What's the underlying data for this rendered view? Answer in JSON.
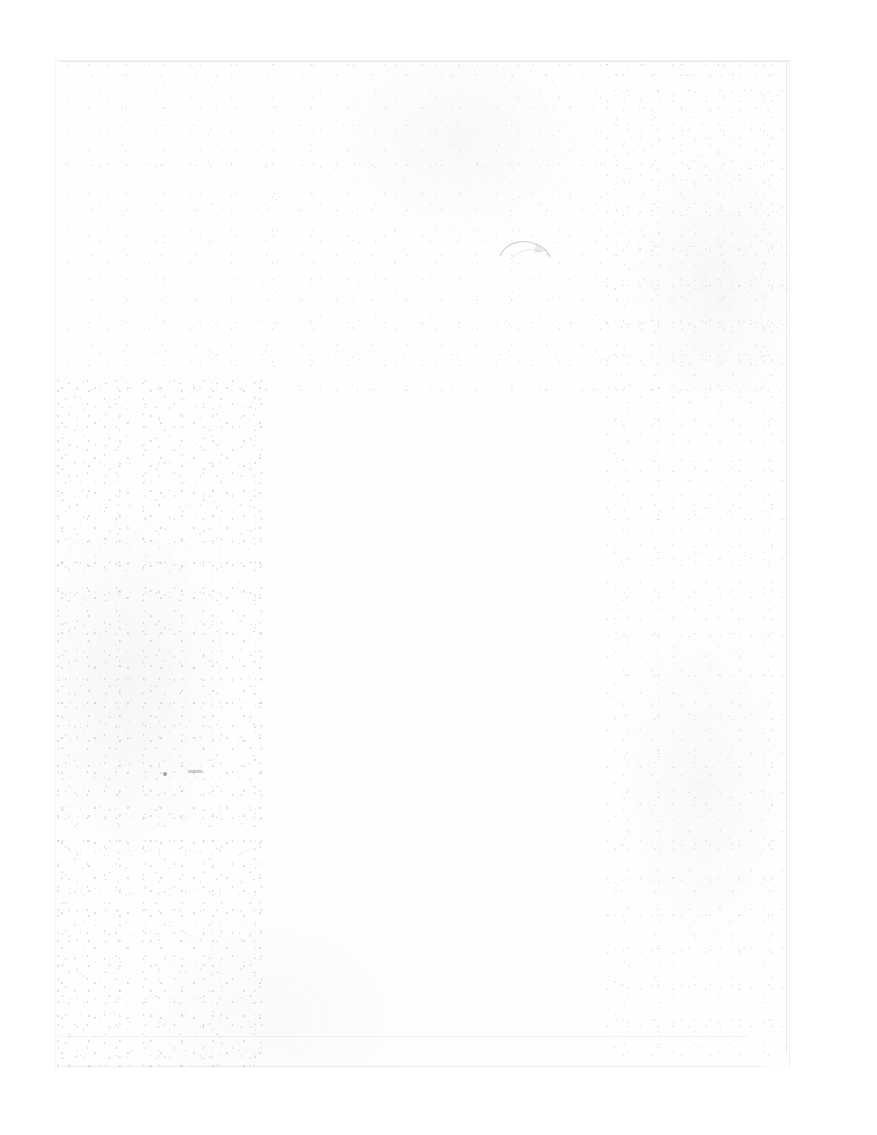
{
  "document": {
    "kind": "scanned-page",
    "condition": "blank / heavily faded",
    "text_content": "",
    "visible_text": [],
    "page_width_px": 877,
    "page_height_px": 1135,
    "background_color": "#ffffff",
    "paper_color": "#fefefe"
  },
  "scan_region": {
    "label": "",
    "left_px": 55,
    "top_px": 60,
    "width_px": 735,
    "height_px": 1008,
    "edge_color": "#8c8c8c"
  },
  "artifacts": {
    "speckle_left": {
      "label": "",
      "density": "heavy"
    },
    "speckle_top": {
      "label": "",
      "density": "moderate"
    },
    "speckle_right": {
      "label": "",
      "density": "moderate"
    },
    "speckle_center": {
      "label": "",
      "density": "light"
    },
    "arc_smudge": {
      "label": "",
      "left_px": 498,
      "top_px": 236
    },
    "dark_fleck": {
      "label": "",
      "left_px": 163,
      "top_px": 772
    },
    "rule_trace": {
      "label": "",
      "top_px": 1036
    },
    "bottom_edge": {
      "label": "",
      "top_px": 1066
    }
  }
}
